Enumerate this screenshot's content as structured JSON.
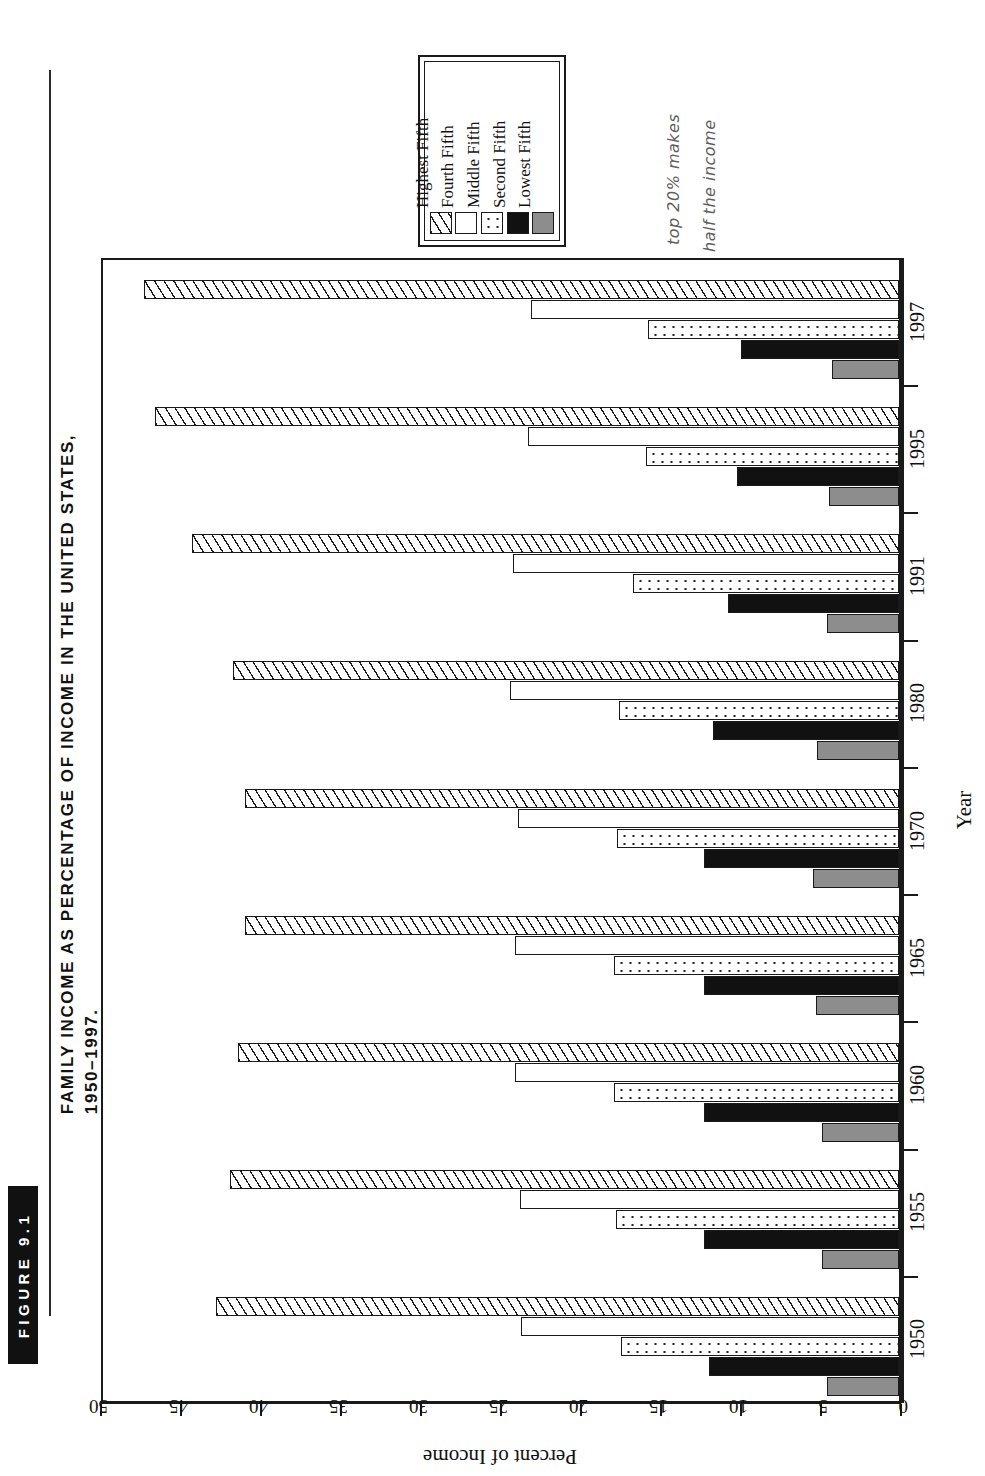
{
  "figure": {
    "badge_label": "FIGURE 9.1",
    "title_line1": "FAMILY INCOME AS PERCENTAGE OF INCOME IN THE UNITED STATES,",
    "title_line2": "1950–1997."
  },
  "annotation": {
    "line1": "top 20% makes",
    "line2": "half the income"
  },
  "legend": {
    "items": [
      {
        "label": "Lowest Fifth",
        "fill": "gray",
        "color": "#8d8d8d"
      },
      {
        "label": "Second Fifth",
        "fill": "black",
        "color": "#111111"
      },
      {
        "label": "Middle Fifth",
        "fill": "dot",
        "color": "#ffffff"
      },
      {
        "label": "Fourth Fifth",
        "fill": "white",
        "color": "#ffffff"
      },
      {
        "label": "Highest Fifth",
        "fill": "hatch",
        "color": "#ffffff"
      }
    ]
  },
  "axes": {
    "value_title": "Percent of Income",
    "category_title": "Year",
    "value_ticks": [
      "50",
      "45",
      "40",
      "35",
      "30",
      "25",
      "20",
      "15",
      "10",
      "5",
      "0"
    ],
    "value_min": 0,
    "value_max": 50,
    "value_reversed": true
  },
  "chart_data": {
    "type": "bar",
    "orientation": "horizontal-rotated",
    "title": "Family Income as Percentage of Income in the United States, 1950–1997.",
    "xlabel": "Year",
    "ylabel": "Percent of Income",
    "ylim": [
      0,
      50
    ],
    "grid": false,
    "legend_position": "top-center",
    "categories": [
      "1950",
      "1955",
      "1960",
      "1965",
      "1970",
      "1980",
      "1991",
      "1995",
      "1997"
    ],
    "series": [
      {
        "name": "Lowest Fifth",
        "values": [
          4.5,
          4.8,
          4.8,
          5.2,
          5.4,
          5.1,
          4.5,
          4.4,
          4.2
        ]
      },
      {
        "name": "Second Fifth",
        "values": [
          11.9,
          12.2,
          12.2,
          12.2,
          12.2,
          11.6,
          10.7,
          10.1,
          9.9
        ]
      },
      {
        "name": "Middle Fifth",
        "values": [
          17.4,
          17.7,
          17.8,
          17.8,
          17.6,
          17.5,
          16.6,
          15.8,
          15.7
        ]
      },
      {
        "name": "Fourth Fifth",
        "values": [
          23.6,
          23.7,
          24.0,
          24.0,
          23.8,
          24.3,
          24.1,
          23.2,
          23.0
        ]
      },
      {
        "name": "Highest Fifth",
        "values": [
          42.7,
          41.8,
          41.3,
          40.9,
          40.9,
          41.6,
          44.2,
          46.5,
          47.2
        ]
      }
    ]
  }
}
